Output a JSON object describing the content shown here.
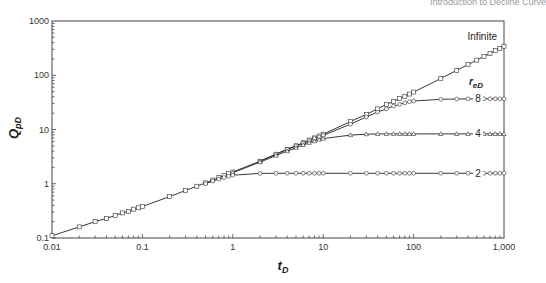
{
  "header": {
    "running_title": "Introduction to Decline Curve"
  },
  "chart_data": {
    "type": "line",
    "title": "",
    "xlabel": "tD",
    "ylabel": "QpD",
    "xscale": "log",
    "yscale": "log",
    "xlim": [
      0.01,
      1000
    ],
    "ylim": [
      0.1,
      1000
    ],
    "x_ticks": [
      "0.01",
      "0.1",
      "1",
      "10",
      "100",
      "1,000"
    ],
    "y_ticks": [
      "0.1",
      "1",
      "10",
      "100",
      "1000"
    ],
    "grid": false,
    "legend_title": "reD",
    "series": [
      {
        "name": "Infinite",
        "marker": "square",
        "x": [
          0.01,
          0.02,
          0.03,
          0.04,
          0.05,
          0.06,
          0.07,
          0.08,
          0.09,
          0.1,
          0.2,
          0.3,
          0.4,
          0.5,
          0.6,
          0.7,
          0.8,
          0.9,
          1,
          2,
          3,
          4,
          5,
          6,
          7,
          8,
          9,
          10,
          20,
          30,
          40,
          50,
          60,
          70,
          80,
          90,
          100,
          200,
          300,
          400,
          500,
          600,
          700,
          800,
          900,
          1000
        ],
        "y": [
          0.11,
          0.16,
          0.2,
          0.23,
          0.26,
          0.29,
          0.31,
          0.34,
          0.36,
          0.38,
          0.58,
          0.75,
          0.9,
          1.04,
          1.17,
          1.3,
          1.42,
          1.54,
          1.65,
          2.6,
          3.5,
          4.3,
          5.0,
          5.7,
          6.4,
          7.0,
          7.6,
          8.2,
          14,
          19,
          24,
          29,
          33,
          37,
          41,
          45,
          49,
          87,
          123,
          157,
          190,
          222,
          253,
          284,
          314,
          343
        ]
      },
      {
        "name": "8",
        "marker": "circle",
        "x": [
          2,
          3,
          4,
          5,
          6,
          7,
          8,
          9,
          10,
          20,
          30,
          40,
          50,
          60,
          70,
          80,
          90,
          100,
          200,
          300,
          400,
          500,
          600,
          700,
          800,
          900,
          1000
        ],
        "y": [
          2.6,
          3.5,
          4.3,
          5.0,
          5.6,
          6.2,
          6.8,
          7.3,
          7.8,
          12.5,
          17,
          21,
          24,
          27,
          29,
          31,
          32.5,
          33.5,
          36,
          36.5,
          36.7,
          36.8,
          36.8,
          36.8,
          36.8,
          36.8,
          36.8
        ]
      },
      {
        "name": "4",
        "marker": "triangle",
        "x": [
          1,
          2,
          3,
          4,
          5,
          6,
          7,
          8,
          9,
          10,
          20,
          30,
          40,
          50,
          60,
          70,
          80,
          90,
          100,
          200,
          300,
          400,
          500,
          600,
          700,
          800,
          900,
          1000
        ],
        "y": [
          1.6,
          2.5,
          3.3,
          4.0,
          4.6,
          5.2,
          5.7,
          6.1,
          6.5,
          6.8,
          7.9,
          8.2,
          8.3,
          8.3,
          8.3,
          8.3,
          8.3,
          8.3,
          8.3,
          8.3,
          8.3,
          8.3,
          8.3,
          8.3,
          8.3,
          8.3,
          8.3,
          8.3
        ]
      },
      {
        "name": "2",
        "marker": "circle",
        "x": [
          0.5,
          0.6,
          0.7,
          0.8,
          0.9,
          1,
          2,
          3,
          4,
          5,
          6,
          7,
          8,
          9,
          10,
          20,
          30,
          40,
          50,
          60,
          70,
          80,
          90,
          100,
          200,
          300,
          400,
          500,
          600,
          700,
          800,
          900,
          1000
        ],
        "y": [
          1.0,
          1.12,
          1.22,
          1.3,
          1.38,
          1.44,
          1.55,
          1.56,
          1.56,
          1.56,
          1.56,
          1.56,
          1.56,
          1.56,
          1.56,
          1.56,
          1.56,
          1.56,
          1.56,
          1.56,
          1.56,
          1.56,
          1.56,
          1.56,
          1.56,
          1.56,
          1.56,
          1.56,
          1.56,
          1.56,
          1.56,
          1.56,
          1.56
        ]
      }
    ],
    "annotations": [
      "Infinite",
      "reD",
      "8",
      "4",
      "2"
    ]
  }
}
